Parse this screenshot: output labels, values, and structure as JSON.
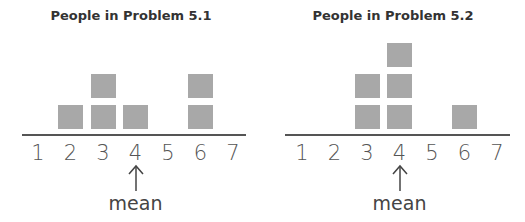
{
  "charts": [
    {
      "title": "People in Problem 5.1",
      "mean_label": "mean",
      "ticks": [
        "1",
        "2",
        "3",
        "4",
        "5",
        "6",
        "7"
      ],
      "counts": [
        0,
        1,
        2,
        1,
        0,
        2,
        0
      ],
      "mean": 4
    },
    {
      "title": "People in Problem 5.2",
      "mean_label": "mean",
      "ticks": [
        "1",
        "2",
        "3",
        "4",
        "5",
        "6",
        "7"
      ],
      "counts": [
        0,
        0,
        2,
        3,
        0,
        1,
        0
      ],
      "mean": 4
    }
  ],
  "chart_data": [
    {
      "type": "bar",
      "title": "People in Problem 5.1",
      "categories": [
        1,
        2,
        3,
        4,
        5,
        6,
        7
      ],
      "values": [
        0,
        1,
        2,
        1,
        0,
        2,
        0
      ],
      "annotation": "mean at 4",
      "xlabel": "",
      "ylabel": ""
    },
    {
      "type": "bar",
      "title": "People in Problem 5.2",
      "categories": [
        1,
        2,
        3,
        4,
        5,
        6,
        7
      ],
      "values": [
        0,
        0,
        2,
        3,
        0,
        1,
        0
      ],
      "annotation": "mean at 4",
      "xlabel": "",
      "ylabel": ""
    }
  ]
}
